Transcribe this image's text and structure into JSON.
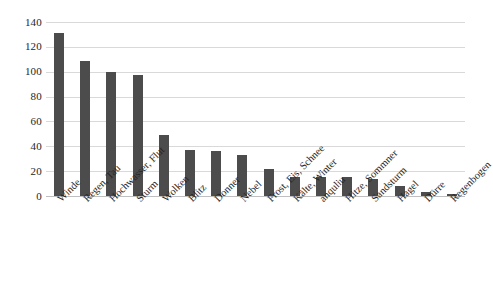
{
  "chart_data": {
    "type": "bar",
    "title": "",
    "subtitle": "",
    "xlabel": "",
    "ylabel": "",
    "ylim": [
      0,
      140
    ],
    "ytick_step": 20,
    "yticks": [
      140,
      120,
      100,
      80,
      60,
      40,
      20,
      0
    ],
    "grid": true,
    "legend": false,
    "legend_position": "none",
    "bar_color": "#4c4c4c",
    "gridline_color": "#d9d9d9",
    "categories": [
      "Winde",
      "Regen, Tau",
      "Hochwasser, Flut",
      "Sturm",
      "Wolken",
      "Blitz",
      "Donner",
      "Nebel",
      "Frost, Eis, Schnee",
      "Kälte, Winter",
      "anquliu",
      "Hitze, Sommner",
      "Sandsturm",
      "Hagel",
      "Dürre",
      "Regenbogen"
    ],
    "values": [
      131,
      109,
      100,
      97,
      49,
      37,
      36,
      33,
      22,
      15,
      15,
      15,
      14,
      8,
      3,
      2
    ]
  }
}
